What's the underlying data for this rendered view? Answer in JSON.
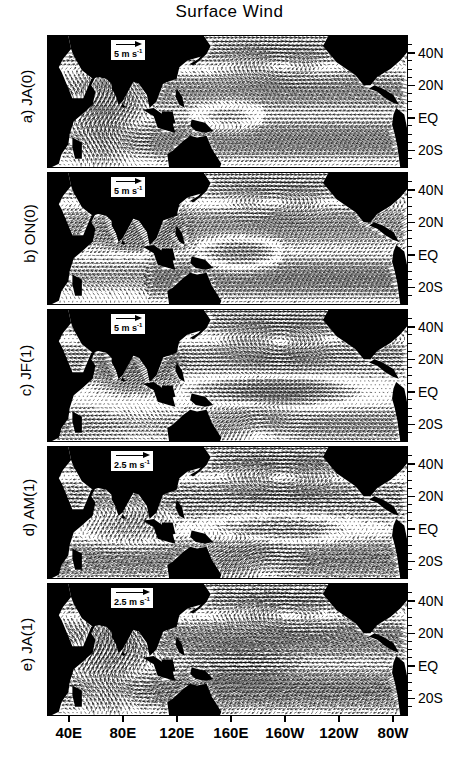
{
  "figure": {
    "title": "Surface Wind",
    "domain": "Tropical Indo-Pacific, 30E-70W, 30S-50N",
    "projection": "cylindrical-equidistant"
  },
  "axes": {
    "longitude": {
      "label": "",
      "ticks": [
        "40E",
        "80E",
        "120E",
        "160E",
        "160W",
        "120W",
        "80W"
      ],
      "tick_values": [
        40,
        80,
        120,
        160,
        200,
        240,
        280
      ],
      "range": [
        25,
        290
      ]
    },
    "latitude": {
      "label": "",
      "ticks": [
        "40N",
        "20N",
        "EQ",
        "20S"
      ],
      "tick_values": [
        40,
        20,
        0,
        -20
      ],
      "range": [
        -30,
        50
      ]
    }
  },
  "panels": [
    {
      "id": "a",
      "label": "a)  JA(0)",
      "tag": "a)",
      "season": "JA(0)",
      "scale": {
        "value": "5",
        "unit": "m s",
        "exponent": "-1",
        "text": "5 m s-1"
      }
    },
    {
      "id": "b",
      "label": "b)  ON(0)",
      "tag": "b)",
      "season": "ON(0)",
      "scale": {
        "value": "5",
        "unit": "m s",
        "exponent": "-1",
        "text": "5 m s-1"
      }
    },
    {
      "id": "c",
      "label": "c)  JF(1)",
      "tag": "c)",
      "season": "JF(1)",
      "scale": {
        "value": "5",
        "unit": "m s",
        "exponent": "-1",
        "text": "5 m s-1"
      }
    },
    {
      "id": "d",
      "label": "d)  AM(1)",
      "tag": "d)",
      "season": "AM(1)",
      "scale": {
        "value": "2.5",
        "unit": "m s",
        "exponent": "-1",
        "text": "2.5 m s-1"
      }
    },
    {
      "id": "e",
      "label": "e)  JA(1)",
      "tag": "e)",
      "season": "JA(1)",
      "scale": {
        "value": "2.5",
        "unit": "m s",
        "exponent": "-1",
        "text": "2.5 m s-1"
      }
    }
  ],
  "chart_data": {
    "type": "quiver",
    "title": "Surface Wind",
    "xlabel": "",
    "ylabel": "",
    "xlim": [
      25,
      290
    ],
    "ylim": [
      -30,
      50
    ],
    "grid": false,
    "legend": "per-panel vector scale box",
    "xticklabels": [
      "40E",
      "80E",
      "120E",
      "160E",
      "160W",
      "120W",
      "80W"
    ],
    "yticklabels": [
      "40N",
      "20N",
      "EQ",
      "20S"
    ],
    "panel_count": 5,
    "panel_labels": [
      "a) JA(0)",
      "b) ON(0)",
      "c) JF(1)",
      "d) AM(1)",
      "e) JA(1)"
    ],
    "vector_scales": [
      "5 m s-1",
      "5 m s-1",
      "5 m s-1",
      "2.5 m s-1",
      "2.5 m s-1"
    ],
    "series": [
      {
        "name": "a) JA(0)",
        "scale_ms": 5,
        "features": [
          {
            "feature": "southwest monsoon flow",
            "region": "Arabian Sea / Indian Ocean",
            "lon": [
              45,
              75
            ],
            "lat": [
              0,
              15
            ],
            "direction": "southwesterly",
            "speed": 8
          },
          {
            "feature": "cross-equatorial southeasterlies",
            "region": "South Indian Ocean",
            "lon": [
              60,
              100
            ],
            "lat": [
              -25,
              -5
            ],
            "direction": "southeasterly",
            "speed": 6
          },
          {
            "feature": "trade easterlies",
            "region": "central Pacific",
            "lon": [
              180,
              240
            ],
            "lat": [
              -20,
              5
            ],
            "direction": "easterly",
            "speed": 6
          },
          {
            "feature": "North Pacific subtropical anticyclone",
            "region": "North Pacific",
            "lon": [
              170,
              215
            ],
            "lat": [
              25,
              42
            ],
            "direction": "clockwise gyre",
            "speed": 5
          },
          {
            "feature": "equatorial westerly anomaly",
            "region": "west Pacific",
            "lon": [
              140,
              175
            ],
            "lat": [
              -5,
              8
            ],
            "direction": "westerly",
            "speed": 4
          }
        ]
      },
      {
        "name": "b) ON(0)",
        "scale_ms": 5,
        "features": [
          {
            "feature": "northeast monsoon onset",
            "region": "Bay of Bengal / South China Sea",
            "lon": [
              85,
              125
            ],
            "lat": [
              5,
              22
            ],
            "direction": "northeasterly",
            "speed": 6
          },
          {
            "feature": "equatorial westerlies",
            "region": "west-central Pacific",
            "lon": [
              140,
              190
            ],
            "lat": [
              -6,
              6
            ],
            "direction": "westerly",
            "speed": 6
          },
          {
            "feature": "trade easterlies",
            "region": "east Pacific",
            "lon": [
              220,
              275
            ],
            "lat": [
              -18,
              10
            ],
            "direction": "easterly",
            "speed": 6
          },
          {
            "feature": "North Pacific anticyclone",
            "region": "North Pacific",
            "lon": [
              165,
              220
            ],
            "lat": [
              22,
              42
            ],
            "direction": "clockwise gyre",
            "speed": 5
          }
        ]
      },
      {
        "name": "c) JF(1)",
        "scale_ms": 5,
        "features": [
          {
            "feature": "strong equatorial westerly burst",
            "region": "central Pacific",
            "lon": [
              150,
              230
            ],
            "lat": [
              -8,
              6
            ],
            "direction": "westerly",
            "speed": 9
          },
          {
            "feature": "mature anticyclonic gyre",
            "region": "North Pacific",
            "lon": [
              170,
              225
            ],
            "lat": [
              18,
              44
            ],
            "direction": "clockwise gyre",
            "speed": 7
          },
          {
            "feature": "southern hemisphere convergence",
            "region": "South Pacific",
            "lon": [
              150,
              210
            ],
            "lat": [
              -28,
              -10
            ],
            "direction": "northwesterly",
            "speed": 6
          },
          {
            "feature": "northeast monsoon",
            "region": "north Indian Ocean",
            "lon": [
              60,
              110
            ],
            "lat": [
              2,
              20
            ],
            "direction": "northeasterly",
            "speed": 5
          }
        ]
      },
      {
        "name": "d) AM(1)",
        "scale_ms": 2.5,
        "features": [
          {
            "feature": "decaying equatorial westerlies",
            "region": "central Pacific",
            "lon": [
              160,
              220
            ],
            "lat": [
              -6,
              6
            ],
            "direction": "westerly",
            "speed": 3
          },
          {
            "feature": "weak trade easterlies",
            "region": "east Pacific",
            "lon": [
              230,
              275
            ],
            "lat": [
              -20,
              8
            ],
            "direction": "easterly",
            "speed": 3
          },
          {
            "feature": "Indian Ocean transition flow",
            "region": "Indian Ocean",
            "lon": [
              50,
              100
            ],
            "lat": [
              -20,
              10
            ],
            "direction": "variable",
            "speed": 2.5
          },
          {
            "feature": "southern subtropical flow",
            "region": "South Pacific",
            "lon": [
              150,
              240
            ],
            "lat": [
              -28,
              -12
            ],
            "direction": "southeasterly",
            "speed": 3
          }
        ]
      },
      {
        "name": "e) JA(1)",
        "scale_ms": 2.5,
        "features": [
          {
            "feature": "southwest monsoon return",
            "region": "Arabian Sea",
            "lon": [
              45,
              80
            ],
            "lat": [
              0,
              18
            ],
            "direction": "southwesterly",
            "speed": 3.5
          },
          {
            "feature": "easterly anomaly",
            "region": "west Pacific",
            "lon": [
              140,
              200
            ],
            "lat": [
              -10,
              5
            ],
            "direction": "easterly",
            "speed": 3
          },
          {
            "feature": "South Indian Ocean southeasterlies",
            "region": "South Indian Ocean",
            "lon": [
              60,
              110
            ],
            "lat": [
              -28,
              -8
            ],
            "direction": "southeasterly",
            "speed": 3
          },
          {
            "feature": "weak North Pacific gyre",
            "region": "North Pacific",
            "lon": [
              170,
              230
            ],
            "lat": [
              20,
              42
            ],
            "direction": "clockwise gyre",
            "speed": 2.5
          }
        ]
      }
    ]
  }
}
